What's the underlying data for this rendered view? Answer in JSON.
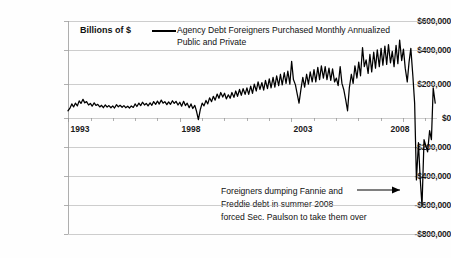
{
  "chart_data": {
    "type": "line",
    "title": "",
    "xlabel": "",
    "ylabel": "Billions of $",
    "ylim": [
      -800000,
      600000
    ],
    "yticks": [
      "$600,000",
      "$400,000",
      "$200,000",
      "$0",
      "-$200,000",
      "-$400,000",
      "-$600,000",
      "-$800,000"
    ],
    "ytick_values": [
      600000,
      400000,
      200000,
      0,
      -200000,
      -400000,
      -600000,
      -800000
    ],
    "xticks": [
      "1993",
      "1998",
      "2003",
      "2008"
    ],
    "xtick_values": [
      1993,
      1998,
      2003,
      2008
    ],
    "xlim": [
      1993,
      2009.5
    ],
    "grid": true,
    "legend_position": "top-center",
    "series": [
      {
        "name": "Agency Debt Foreigners Purchased Monthly Annualized Public and Private",
        "color": "#000000",
        "x": [
          1993.0,
          1993.08,
          1993.17,
          1993.25,
          1993.33,
          1993.42,
          1993.5,
          1993.58,
          1993.67,
          1993.75,
          1993.83,
          1993.92,
          1994.0,
          1994.08,
          1994.17,
          1994.25,
          1994.33,
          1994.42,
          1994.5,
          1994.58,
          1994.67,
          1994.75,
          1994.83,
          1994.92,
          1995.0,
          1995.08,
          1995.17,
          1995.25,
          1995.33,
          1995.42,
          1995.5,
          1995.58,
          1995.67,
          1995.75,
          1995.83,
          1995.92,
          1996.0,
          1996.08,
          1996.17,
          1996.25,
          1996.33,
          1996.42,
          1996.5,
          1996.58,
          1996.67,
          1996.75,
          1996.83,
          1996.92,
          1997.0,
          1997.08,
          1997.17,
          1997.25,
          1997.33,
          1997.42,
          1997.5,
          1997.58,
          1997.67,
          1997.75,
          1997.83,
          1997.92,
          1998.0,
          1998.08,
          1998.17,
          1998.25,
          1998.33,
          1998.42,
          1998.5,
          1998.58,
          1998.67,
          1998.75,
          1998.83,
          1998.92,
          1999.0,
          1999.08,
          1999.17,
          1999.25,
          1999.33,
          1999.42,
          1999.5,
          1999.58,
          1999.67,
          1999.75,
          1999.83,
          1999.92,
          2000.0,
          2000.08,
          2000.17,
          2000.25,
          2000.33,
          2000.42,
          2000.5,
          2000.58,
          2000.67,
          2000.75,
          2000.83,
          2000.92,
          2001.0,
          2001.08,
          2001.17,
          2001.25,
          2001.33,
          2001.42,
          2001.5,
          2001.58,
          2001.67,
          2001.75,
          2001.83,
          2001.92,
          2002.0,
          2002.08,
          2002.17,
          2002.25,
          2002.33,
          2002.42,
          2002.5,
          2002.58,
          2002.67,
          2002.75,
          2002.83,
          2002.92,
          2003.0,
          2003.08,
          2003.17,
          2003.25,
          2003.33,
          2003.42,
          2003.5,
          2003.58,
          2003.67,
          2003.75,
          2003.83,
          2003.92,
          2004.0,
          2004.08,
          2004.17,
          2004.25,
          2004.33,
          2004.42,
          2004.5,
          2004.58,
          2004.67,
          2004.75,
          2004.83,
          2004.92,
          2005.0,
          2005.08,
          2005.17,
          2005.25,
          2005.33,
          2005.42,
          2005.5,
          2005.58,
          2005.67,
          2005.75,
          2005.83,
          2005.92,
          2006.0,
          2006.08,
          2006.17,
          2006.25,
          2006.33,
          2006.42,
          2006.5,
          2006.58,
          2006.67,
          2006.75,
          2006.83,
          2006.92,
          2007.0,
          2007.08,
          2007.17,
          2007.25,
          2007.33,
          2007.42,
          2007.5,
          2007.58,
          2007.67,
          2007.75,
          2007.83,
          2007.92,
          2008.0,
          2008.08,
          2008.17,
          2008.25,
          2008.33,
          2008.42,
          2008.5,
          2008.58,
          2008.67,
          2008.75,
          2008.83,
          2008.92,
          2009.0,
          2009.08,
          2009.17,
          2009.25,
          2009.33,
          2009.42
        ],
        "values": [
          10000,
          25000,
          55000,
          35000,
          60000,
          42000,
          75000,
          58000,
          85000,
          62000,
          70000,
          48000,
          58000,
          40000,
          62000,
          45000,
          52000,
          35000,
          46000,
          30000,
          48000,
          34000,
          44000,
          30000,
          42000,
          28000,
          50000,
          36000,
          46000,
          33000,
          44000,
          30000,
          40000,
          28000,
          42000,
          32000,
          55000,
          38000,
          60000,
          44000,
          66000,
          48000,
          58000,
          42000,
          62000,
          46000,
          70000,
          52000,
          74000,
          54000,
          80000,
          60000,
          70000,
          50000,
          68000,
          52000,
          76000,
          58000,
          72000,
          48000,
          66000,
          40000,
          72000,
          44000,
          60000,
          30000,
          55000,
          25000,
          45000,
          5000,
          -48000,
          20000,
          60000,
          42000,
          78000,
          55000,
          95000,
          70000,
          105000,
          80000,
          120000,
          92000,
          130000,
          100000,
          125000,
          88000,
          115000,
          92000,
          130000,
          98000,
          140000,
          105000,
          150000,
          112000,
          155000,
          118000,
          160000,
          118000,
          172000,
          125000,
          185000,
          140000,
          200000,
          150000,
          195000,
          145000,
          210000,
          155000,
          220000,
          160000,
          230000,
          165000,
          240000,
          175000,
          250000,
          180000,
          260000,
          190000,
          270000,
          185000,
          335000,
          215000,
          180000,
          120000,
          60000,
          155000,
          230000,
          165000,
          250000,
          185000,
          265000,
          200000,
          280000,
          200000,
          295000,
          215000,
          305000,
          225000,
          300000,
          215000,
          290000,
          210000,
          285000,
          200000,
          225000,
          175000,
          300000,
          190000,
          150000,
          80000,
          10000,
          160000,
          250000,
          190000,
          305000,
          225000,
          330000,
          240000,
          425000,
          300000,
          345000,
          255000,
          380000,
          265000,
          395000,
          290000,
          410000,
          300000,
          420000,
          310000,
          435000,
          315000,
          445000,
          325000,
          400000,
          300000,
          440000,
          320000,
          475000,
          340000,
          415000,
          290000,
          200000,
          330000,
          420000,
          240000,
          60000,
          -445000,
          -200000,
          -440000,
          -615000,
          -180000,
          -220000,
          -260000,
          -120000,
          -180000,
          160000,
          60000
        ],
        "n_points": 198
      }
    ],
    "annotations": [
      {
        "text_lines": [
          "Foreigners dumping Fannie and",
          "Freddie debt in summer 2008",
          "forced Sec. Paulson to take them over"
        ],
        "arrow": "right-arrow"
      }
    ]
  },
  "legend": {
    "axis_label": "Billions of $",
    "series_line_1": "Agency Debt Foreigners Purchased Monthly Annualized",
    "series_line_2": "Public and Private"
  },
  "annotation": {
    "line1": "Foreigners dumping Fannie and",
    "line2": "Freddie debt in summer 2008",
    "line3": "forced Sec. Paulson to take them over"
  },
  "colors": {
    "series": "#000000",
    "grid": "#b8b8b8",
    "text": "#111111",
    "background": "#ffffff"
  }
}
